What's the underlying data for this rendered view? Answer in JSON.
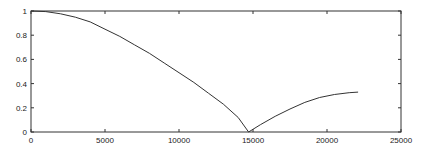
{
  "chart_data": {
    "type": "line",
    "title": "",
    "xlabel": "",
    "ylabel": "",
    "xlim": [
      0,
      25000
    ],
    "ylim": [
      0,
      1
    ],
    "grid": false,
    "legend": null,
    "x_ticks": [
      0,
      5000,
      10000,
      15000,
      20000,
      25000
    ],
    "x_tick_labels": [
      "0",
      "5000",
      "10000",
      "15000",
      "20000",
      "25000"
    ],
    "y_ticks": [
      0,
      0.2,
      0.4,
      0.6,
      0.8,
      1
    ],
    "y_tick_labels": [
      "0",
      "0.2",
      "0.4",
      "0.6",
      "0.8",
      "1"
    ],
    "series": [
      {
        "name": "curve",
        "color": "#333333",
        "x": [
          0,
          1000,
          2000,
          3000,
          4000,
          5000,
          6000,
          7000,
          8000,
          9000,
          10000,
          11000,
          12000,
          13000,
          14000,
          14700,
          15500,
          16500,
          17500,
          18500,
          19500,
          20500,
          21500,
          22100
        ],
        "y": [
          1.0,
          0.995,
          0.977,
          0.949,
          0.91,
          0.85,
          0.79,
          0.72,
          0.65,
          0.57,
          0.49,
          0.41,
          0.32,
          0.23,
          0.12,
          0.0,
          0.06,
          0.13,
          0.19,
          0.245,
          0.285,
          0.31,
          0.325,
          0.33
        ]
      }
    ]
  }
}
